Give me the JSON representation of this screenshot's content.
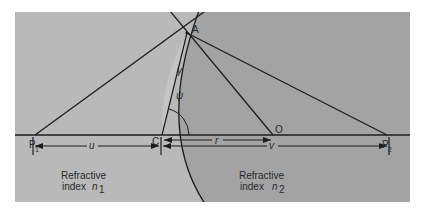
{
  "figure": {
    "type": "refraction at a spherical surface",
    "colors": {
      "background": "#ffffff",
      "medium_1": "#b9b9b9",
      "medium_2": "#a3a3a3",
      "lens_sliver": "#c2c2c2",
      "lines": "#1e1e1e"
    },
    "points": {
      "P1": {
        "label": "P",
        "subscript": "1"
      },
      "C": {
        "label": "C"
      },
      "O": {
        "label": "O"
      },
      "P2": {
        "label": "P",
        "subscript": "2"
      },
      "A": {
        "label": "A"
      }
    },
    "symbols": {
      "gamma": "γ",
      "psi": "ψ",
      "r": "r",
      "u": "u",
      "v": "v"
    },
    "regions": [
      {
        "line1": "Refractive",
        "line2": "index",
        "symbol": "n",
        "subscript": "1"
      },
      {
        "line1": "Refractive",
        "line2": "index",
        "symbol": "n",
        "subscript": "2"
      }
    ]
  }
}
